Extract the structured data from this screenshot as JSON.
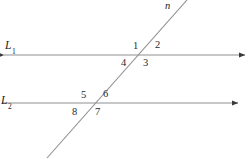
{
  "figure": {
    "type": "geometry-diagram",
    "width": 250,
    "height": 159,
    "background_color": "#ffffff",
    "stroke_color": "#8c8c8c",
    "label_color": "#1b1b1b"
  },
  "lines": {
    "line1": {
      "label": "L",
      "subscript": "1",
      "label_x": 5,
      "label_y": 40,
      "x1": 4,
      "y1": 55,
      "x2": 245,
      "y2": 55,
      "arrow_start": true,
      "arrow_end": true
    },
    "line2": {
      "label": "L",
      "subscript": "2",
      "label_x": 1,
      "label_y": 95,
      "x1": 2,
      "y1": 103,
      "x2": 238,
      "y2": 103,
      "arrow_start": false,
      "arrow_end": true
    },
    "transversal": {
      "label": "n",
      "label_x": 165,
      "label_y": 1,
      "x1": 47,
      "y1": 158,
      "x2": 187,
      "y2": 0,
      "arrow_start": false,
      "arrow_end": false
    }
  },
  "intersections": {
    "upper": {
      "x": 143,
      "y": 55
    },
    "lower": {
      "x": 95,
      "y": 103
    }
  },
  "angles": [
    {
      "id": "angle-1",
      "label": "1",
      "x": 133,
      "y": 41,
      "intersection": "upper",
      "position": "top-left"
    },
    {
      "id": "angle-2",
      "label": "2",
      "x": 155,
      "y": 40,
      "intersection": "upper",
      "position": "top-right"
    },
    {
      "id": "angle-3",
      "label": "3",
      "x": 143,
      "y": 58,
      "intersection": "upper",
      "position": "bottom-right"
    },
    {
      "id": "angle-4",
      "label": "4",
      "x": 121,
      "y": 58,
      "intersection": "upper",
      "position": "bottom-left"
    },
    {
      "id": "angle-5",
      "label": "5",
      "x": 81,
      "y": 90,
      "intersection": "lower",
      "position": "top-left"
    },
    {
      "id": "angle-6",
      "label": "6",
      "x": 103,
      "y": 89,
      "intersection": "lower",
      "position": "top-right"
    },
    {
      "id": "angle-7",
      "label": "7",
      "x": 95,
      "y": 107,
      "intersection": "lower",
      "position": "bottom-right"
    },
    {
      "id": "angle-8",
      "label": "8",
      "x": 72,
      "y": 107,
      "intersection": "lower",
      "position": "bottom-left"
    }
  ]
}
